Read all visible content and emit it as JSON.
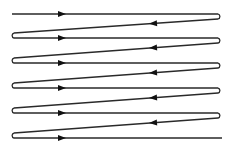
{
  "diagram": {
    "type": "raster-scan-path",
    "colors": {
      "line": "#2a2a2a",
      "arrow": "#111111",
      "background": "#ffffff"
    },
    "left_x": 14,
    "right_x": 218,
    "loop_radius": 2.6,
    "start": {
      "x": 12,
      "y": 14
    },
    "end": {
      "x": 222,
      "y": 138
    },
    "forward_rows_y": [
      14,
      38,
      63,
      88,
      113,
      138
    ],
    "return_drop": 5,
    "forward_arrow_x": 62,
    "return_arrow_x": 153,
    "rows": 6,
    "direction_labels": {
      "forward": "left-to-right",
      "return": "right-to-left"
    }
  }
}
